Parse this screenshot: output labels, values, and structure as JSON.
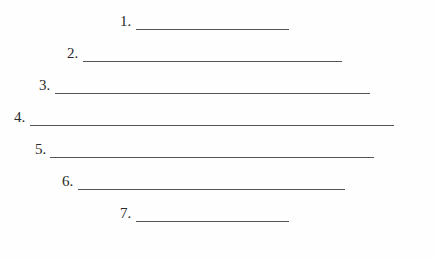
{
  "worksheet": {
    "lines": [
      {
        "label": "1.",
        "label_x": 120,
        "line_x": 136,
        "line_w": 153,
        "y": 30
      },
      {
        "label": "2.",
        "label_x": 67,
        "line_x": 83,
        "line_w": 259,
        "y": 62
      },
      {
        "label": "3.",
        "label_x": 39,
        "line_x": 55,
        "line_w": 315,
        "y": 94
      },
      {
        "label": "4.",
        "label_x": 14,
        "line_x": 30,
        "line_w": 364,
        "y": 126
      },
      {
        "label": "5.",
        "label_x": 35,
        "line_x": 50,
        "line_w": 324,
        "y": 158
      },
      {
        "label": "6.",
        "label_x": 62,
        "line_x": 78,
        "line_w": 267,
        "y": 190
      },
      {
        "label": "7.",
        "label_x": 120,
        "line_x": 136,
        "line_w": 153,
        "y": 222
      }
    ],
    "line_color": "#555555",
    "text_color": "#2a2a2a"
  }
}
